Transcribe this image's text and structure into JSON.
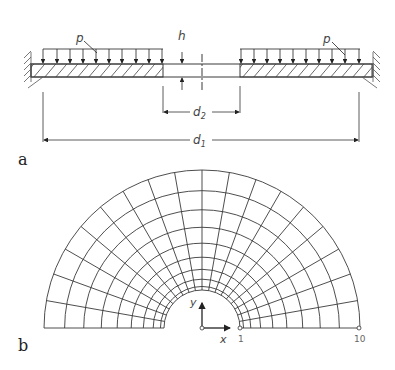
{
  "figure_a": {
    "panel_label": "a",
    "load_label_left": "p",
    "load_label_right": "p",
    "thickness_label": "h",
    "inner_diameter_label": "d",
    "inner_diameter_sub": "2",
    "outer_diameter_label": "d",
    "outer_diameter_sub": "1"
  },
  "figure_b": {
    "panel_label": "b",
    "x_axis_label": "x",
    "y_axis_label": "y",
    "node_inner_label": "1",
    "node_outer_label": "10",
    "ring_count": 10,
    "radial_segments": 9
  },
  "colors": {
    "line": "#3a3a3a",
    "background": "#ffffff"
  }
}
